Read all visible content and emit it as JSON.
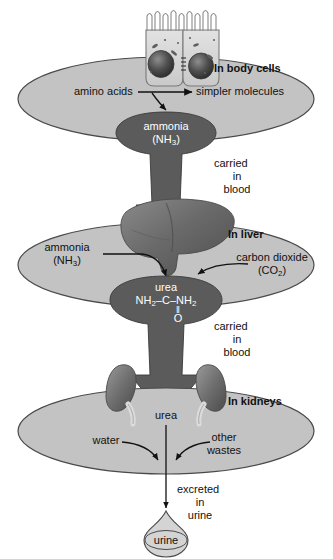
{
  "diagram": {
    "colors": {
      "ellipse_fill": "#c3c3c3",
      "ellipse_stroke": "#4a4a4a",
      "arrow_fill": "#5b5b5b",
      "arrow_stroke": "#333333",
      "organ_dark": "#6d6d6d",
      "organ_light": "#d8d8d8",
      "background": "#ffffff",
      "text_dark": "#111111",
      "text_light": "#ffffff"
    },
    "stages": [
      {
        "id": "body-cells",
        "heading": "In body cells",
        "reactant": "amino acids",
        "product": "simpler molecules"
      },
      {
        "id": "liver",
        "heading": "In liver",
        "input_left": "ammonia",
        "input_left_formula": "(NH3)",
        "input_right": "carbon dioxide",
        "input_right_formula": "(CO2)"
      },
      {
        "id": "kidneys",
        "heading": "In kidneys",
        "input_center": "urea",
        "input_left": "water",
        "input_right_line1": "other",
        "input_right_line2": "wastes"
      }
    ],
    "molecules": {
      "ammonia_name": "ammonia",
      "ammonia_formula": "(NH3)",
      "urea_name": "urea",
      "urea_formula_line1": "NH2–C–NH2",
      "urea_formula_bond": "‖",
      "urea_formula_atom": "O"
    },
    "transport": {
      "first_line1": "carried",
      "first_line2": "in",
      "first_line3": "blood",
      "second_line1": "carried",
      "second_line2": "in",
      "second_line3": "blood"
    },
    "excretion": {
      "line1": "excreted",
      "line2": "in",
      "line3": "urine",
      "droplet_label": "urine"
    },
    "illustrations": {
      "cells": "epithelial-cells-illustration",
      "liver": "liver-organ-illustration",
      "kidneys": "kidneys-organ-illustration",
      "droplet": "urine-droplet-shape"
    }
  }
}
